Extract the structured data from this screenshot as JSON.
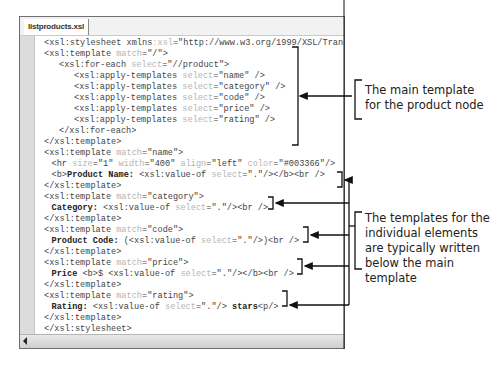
{
  "editor": {
    "tab_label": "listproducts.xsl",
    "lines": [
      {
        "indent": 0,
        "parts": [
          [
            "t",
            "<xsl:stylesheet xmlns"
          ],
          [
            "a",
            ":xsl"
          ],
          [
            "t",
            "=\"http://www.w3.org/1999/XSL/Tran"
          ]
        ]
      },
      {
        "indent": 0,
        "parts": [
          [
            "t",
            "<xsl:template "
          ],
          [
            "a",
            "match"
          ],
          [
            "t",
            "=\"/\">"
          ]
        ]
      },
      {
        "indent": 1,
        "parts": [
          [
            "t",
            "<xsl:for-each "
          ],
          [
            "a",
            "select"
          ],
          [
            "t",
            "=\"//product\">"
          ]
        ]
      },
      {
        "indent": 2,
        "parts": [
          [
            "t",
            "<xsl:apply-templates "
          ],
          [
            "a",
            "select"
          ],
          [
            "t",
            "=\"name\" />"
          ]
        ]
      },
      {
        "indent": 2,
        "parts": [
          [
            "t",
            "<xsl:apply-templates "
          ],
          [
            "a",
            "select"
          ],
          [
            "t",
            "=\"category\" />"
          ]
        ]
      },
      {
        "indent": 2,
        "parts": [
          [
            "t",
            "<xsl:apply-templates "
          ],
          [
            "a",
            "select"
          ],
          [
            "t",
            "=\"code\" />"
          ]
        ]
      },
      {
        "indent": 2,
        "parts": [
          [
            "t",
            "<xsl:apply-templates "
          ],
          [
            "a",
            "select"
          ],
          [
            "t",
            "=\"price\" />"
          ]
        ]
      },
      {
        "indent": 2,
        "parts": [
          [
            "t",
            "<xsl:apply-templates "
          ],
          [
            "a",
            "select"
          ],
          [
            "t",
            "=\"rating\" />"
          ]
        ]
      },
      {
        "indent": 1,
        "parts": [
          [
            "t",
            "</xsl:for-each>"
          ]
        ]
      },
      {
        "indent": 0,
        "parts": [
          [
            "t",
            "</xsl:template>"
          ]
        ]
      },
      {
        "indent": 0,
        "parts": [
          [
            "t",
            "<xsl:template "
          ],
          [
            "a",
            "match"
          ],
          [
            "t",
            "=\"name\">"
          ]
        ]
      },
      {
        "indent": 0.5,
        "parts": [
          [
            "t",
            "<hr "
          ],
          [
            "a",
            "size"
          ],
          [
            "t",
            "=\"1\" "
          ],
          [
            "a",
            "width"
          ],
          [
            "t",
            "=\"400\" "
          ],
          [
            "a",
            "align"
          ],
          [
            "t",
            "=\"left\" "
          ],
          [
            "a",
            "color"
          ],
          [
            "t",
            "=\"#003366\"/>"
          ]
        ]
      },
      {
        "indent": 0.5,
        "parts": [
          [
            "t",
            "<b>"
          ],
          [
            "b",
            "Product Name: "
          ],
          [
            "t",
            "<xsl:value-of "
          ],
          [
            "a",
            "select"
          ],
          [
            "t",
            "=\".\"/></b><br />"
          ]
        ]
      },
      {
        "indent": 0,
        "parts": [
          [
            "t",
            "</xsl:template>"
          ]
        ]
      },
      {
        "indent": 0,
        "parts": [
          [
            "t",
            "<xsl:template "
          ],
          [
            "a",
            "match"
          ],
          [
            "t",
            "=\"category\">"
          ]
        ]
      },
      {
        "indent": 0.5,
        "parts": [
          [
            "b",
            "Category: "
          ],
          [
            "t",
            "<xsl:value-of "
          ],
          [
            "a",
            "select"
          ],
          [
            "t",
            "=\".\"/><br />"
          ]
        ]
      },
      {
        "indent": 0,
        "parts": [
          [
            "t",
            "</xsl:template>"
          ]
        ]
      },
      {
        "indent": 0,
        "parts": [
          [
            "t",
            "<xsl:template "
          ],
          [
            "a",
            "match"
          ],
          [
            "t",
            "=\"code\">"
          ]
        ]
      },
      {
        "indent": 0.5,
        "parts": [
          [
            "b",
            "Product Code: "
          ],
          [
            "t",
            "(<xsl:value-of "
          ],
          [
            "a",
            "select"
          ],
          [
            "t",
            "=\".\"/>)<br />"
          ]
        ]
      },
      {
        "indent": 0,
        "parts": [
          [
            "t",
            "</xsl:template>"
          ]
        ]
      },
      {
        "indent": 0,
        "parts": [
          [
            "t",
            "<xsl:template "
          ],
          [
            "a",
            "match"
          ],
          [
            "t",
            "=\"price\">"
          ]
        ]
      },
      {
        "indent": 0.5,
        "parts": [
          [
            "b",
            "Price "
          ],
          [
            "t",
            "<b>$ <xsl:value-of "
          ],
          [
            "a",
            "select"
          ],
          [
            "t",
            "=\".\"/></b><br />"
          ]
        ]
      },
      {
        "indent": 0,
        "parts": [
          [
            "t",
            "</xsl:template>"
          ]
        ]
      },
      {
        "indent": 0,
        "parts": [
          [
            "t",
            "<xsl:template "
          ],
          [
            "a",
            "match"
          ],
          [
            "t",
            "=\"rating\">"
          ]
        ]
      },
      {
        "indent": 0.5,
        "parts": [
          [
            "b",
            "Rating: "
          ],
          [
            "t",
            "<xsl:value-of "
          ],
          [
            "a",
            "select"
          ],
          [
            "t",
            "=\".\"/> "
          ],
          [
            "b",
            "stars"
          ],
          [
            "t",
            "<p/>"
          ]
        ]
      },
      {
        "indent": 0,
        "parts": [
          [
            "t",
            "</xsl:template>"
          ]
        ]
      },
      {
        "indent": 0,
        "parts": [
          [
            "t",
            "</xsl:stylesheet>"
          ]
        ]
      }
    ]
  },
  "callouts": {
    "main_template": "The main template for the product node",
    "individual_templates": "The templates for the individual elements are typically written below the main template"
  }
}
